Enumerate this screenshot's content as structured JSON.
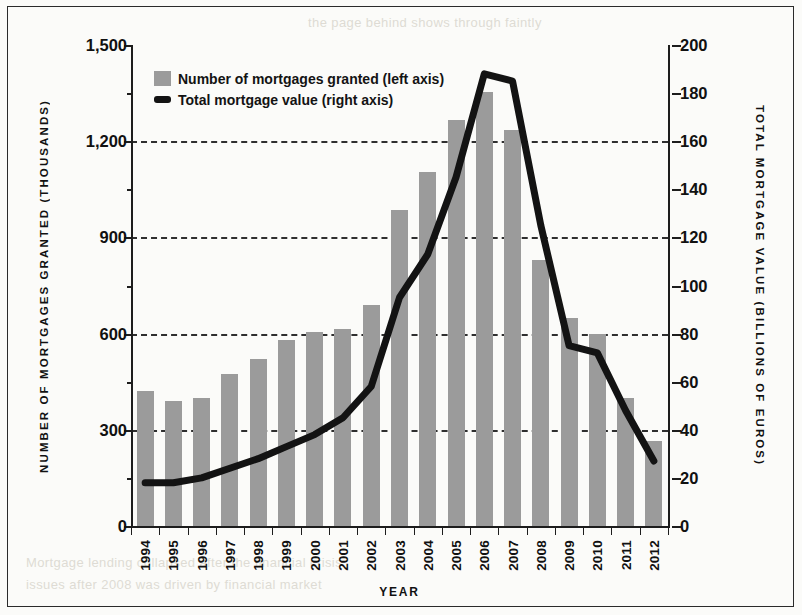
{
  "chart_data": {
    "type": "bar",
    "title": "",
    "xlabel": "YEAR",
    "ylabel": "NUMBER OF MORTGAGES GRANTED (THOUSANDS)",
    "ylabel_right": "TOTAL MORTGAGE VALUE (BILLIONS OF EUROS)",
    "categories": [
      "1994",
      "1995",
      "1996",
      "1997",
      "1998",
      "1999",
      "2000",
      "2001",
      "2002",
      "2003",
      "2004",
      "2005",
      "2006",
      "2007",
      "2008",
      "2009",
      "2010",
      "2011",
      "2012"
    ],
    "series": [
      {
        "name": "Number of mortgages granted (left axis)",
        "type": "bar",
        "axis": "left",
        "color": "#9b9b9b",
        "values": [
          420,
          390,
          400,
          475,
          520,
          580,
          605,
          615,
          690,
          985,
          1105,
          1265,
          1355,
          1235,
          830,
          650,
          600,
          400,
          265
        ]
      },
      {
        "name": "Total mortgage value (right axis)",
        "type": "line",
        "axis": "right",
        "color": "#131313",
        "values": [
          18,
          18,
          20,
          24,
          28,
          33,
          38,
          45,
          58,
          95,
          113,
          145,
          188,
          185,
          125,
          75,
          72,
          48,
          27
        ]
      }
    ],
    "ylim": [
      0,
      1500
    ],
    "ylim_right": [
      0,
      200
    ],
    "yticks": [
      0,
      300,
      600,
      900,
      1200,
      1500
    ],
    "ytick_labels": [
      "0",
      "300",
      "600",
      "900",
      "1,200",
      "1,500"
    ],
    "yticks_minor": [
      150,
      450,
      750,
      1050,
      1350
    ],
    "yticks_right": [
      0,
      20,
      40,
      60,
      80,
      100,
      120,
      140,
      160,
      180,
      200
    ],
    "ytick_labels_right": [
      "0",
      "20",
      "40",
      "60",
      "80",
      "100",
      "120",
      "140",
      "160",
      "180",
      "200"
    ],
    "gridlines_at": [
      300,
      600,
      900,
      1200
    ],
    "grid": true,
    "grid_style": "dashed",
    "legend_position": "top-left"
  },
  "legend": {
    "items": [
      {
        "label": "Number of mortgages granted (left axis)",
        "marker": "bar-swatch"
      },
      {
        "label": "Total mortgage value (right axis)",
        "marker": "line-swatch"
      }
    ]
  },
  "axis_titles": {
    "left": "NUMBER OF MORTGAGES GRANTED (THOUSANDS)",
    "right": "TOTAL MORTGAGE VALUE (BILLIONS OF EUROS)",
    "bottom": "YEAR"
  },
  "ghost_text": {
    "top": "the page behind shows through faintly",
    "bottom_1": "Mortgage lending collapsed after the financial crisis",
    "bottom_2": "issues after 2008 was driven by financial market"
  }
}
